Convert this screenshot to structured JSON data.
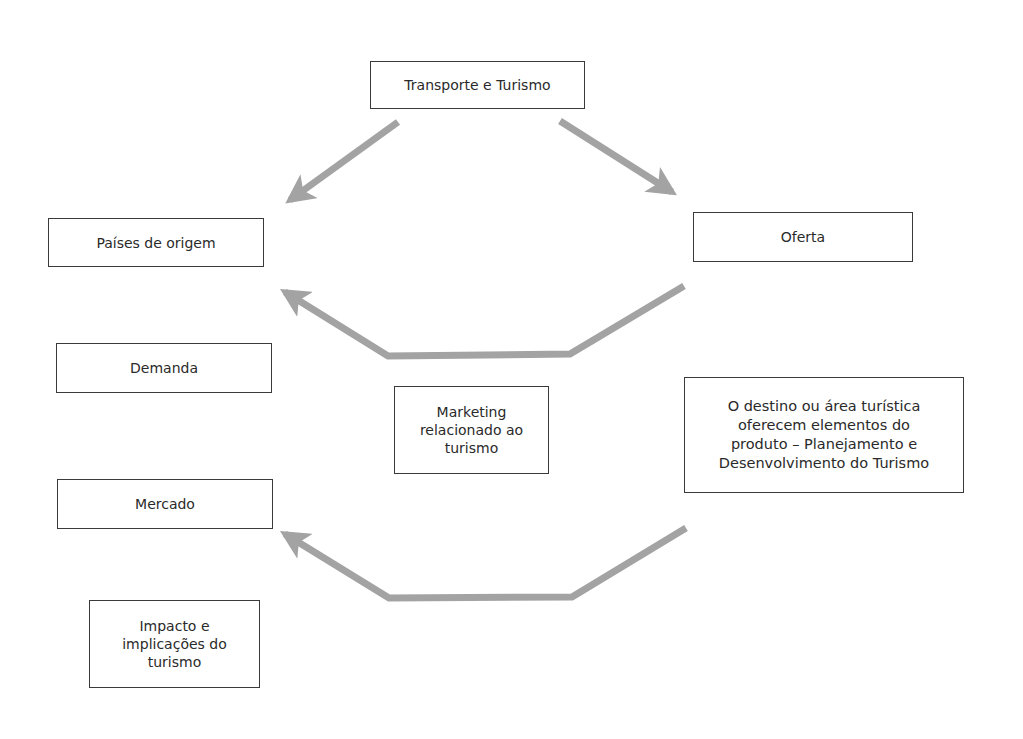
{
  "diagram": {
    "nodes": {
      "transporte": {
        "label": "Transporte e Turismo"
      },
      "paises_origem": {
        "label": "Países de origem"
      },
      "oferta": {
        "label": "Oferta"
      },
      "demanda": {
        "label": "Demanda"
      },
      "marketing": {
        "label": "Marketing\nrelacionado ao\nturismo"
      },
      "destino": {
        "label": "O destino ou área turística\noferecem elementos do\nproduto – Planejamento e\nDesenvolvimento do Turismo"
      },
      "mercado": {
        "label": "Mercado"
      },
      "impacto": {
        "label": "Impacto e\nimplicações do\nturismo"
      }
    },
    "edges": [
      {
        "from": "transporte",
        "to": "paises_origem",
        "style": "gray-arrow"
      },
      {
        "from": "transporte",
        "to": "oferta",
        "style": "gray-arrow"
      },
      {
        "from": "oferta",
        "to": "paises_origem",
        "style": "gray-bent-arrow"
      },
      {
        "from": "destino",
        "to": "mercado",
        "style": "gray-bent-arrow"
      }
    ],
    "colors": {
      "arrow": "#a3a3a3",
      "box_border": "#3a3a3a",
      "text": "#2a2a2a"
    }
  }
}
